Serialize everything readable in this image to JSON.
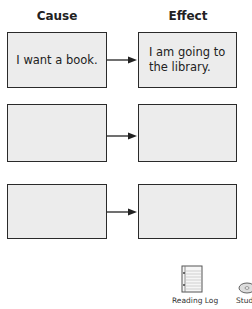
{
  "headers": {
    "cause": "Cause",
    "effect": "Effect"
  },
  "rows": [
    {
      "cause": "I want a book.",
      "effect": "I am going to the library."
    },
    {
      "cause": "",
      "effect": ""
    },
    {
      "cause": "",
      "effect": ""
    }
  ],
  "footer_icons": [
    {
      "name": "reading-log",
      "label": "Reading Log"
    },
    {
      "name": "student-cd",
      "label": "Stud"
    }
  ]
}
